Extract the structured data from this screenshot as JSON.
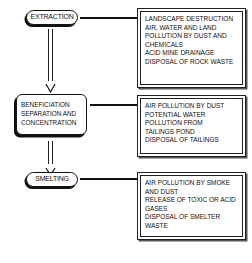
{
  "diagram": {
    "type": "process-flow",
    "stages": [
      {
        "id": "extraction",
        "label": [
          "EXTRACTION"
        ],
        "impacts": [
          "LANDSCAPE DESTRUCTION",
          "AIR, WATER AND LAND",
          "POLLUTION BY DUST AND",
          "CHEMICALS",
          "ACID MINE DRAINAGE",
          "DISPOSAL OF ROCK WASTE"
        ]
      },
      {
        "id": "beneficiation",
        "label": [
          "BENEFICIATION",
          "SEPARATION AND",
          "CONCENTRATION"
        ],
        "impacts": [
          "AIR POLLUTION BY DUST",
          "POTENTIAL WATER",
          "POLLUTION FROM",
          "TAILINGS POND",
          "DISPOSAL OF TAILINGS"
        ]
      },
      {
        "id": "smelting",
        "label": [
          "SMELTING"
        ],
        "impacts": [
          "AIR POLLUTION BY SMOKE",
          "AND DUST",
          "RELEASE OF TOXIC OR ACID",
          "GASES",
          "DISPOSAL OF SMELTER",
          "WASTE"
        ]
      }
    ],
    "colors": {
      "ink": "#111111",
      "background": "#ffffff"
    }
  }
}
